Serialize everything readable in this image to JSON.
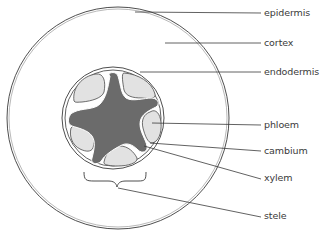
{
  "colors": {
    "outline": "#3a3a3a",
    "xylem_fill": "#6b6b6b",
    "phloem_fill": "#e2e2e2",
    "background": "#ffffff"
  },
  "labels": [
    {
      "id": "epidermis",
      "text": "epidermis"
    },
    {
      "id": "cortex",
      "text": "cortex"
    },
    {
      "id": "endodermis",
      "text": "endodermis"
    },
    {
      "id": "phloem",
      "text": "phloem"
    },
    {
      "id": "cambium",
      "text": "cambium"
    },
    {
      "id": "xylem",
      "text": "xylem"
    },
    {
      "id": "stele",
      "text": "stele"
    }
  ]
}
